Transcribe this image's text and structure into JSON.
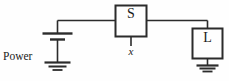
{
  "figure": {
    "kind": "circuit-diagram",
    "width": 229,
    "height": 81,
    "background_color": "#fefefe",
    "line_color": "#2b2b2b",
    "text_color": "#1a1a1a"
  },
  "labels": {
    "power_supply_line1": "Power",
    "power_supply_line2": "supply",
    "switch_box": "S",
    "load_box": "L",
    "switch_node": "x"
  },
  "components": [
    {
      "name": "power-supply",
      "type": "battery",
      "label": "Power supply",
      "plates": 2,
      "grounded": true
    },
    {
      "name": "switch",
      "type": "box",
      "label": "S",
      "node_label": "x"
    },
    {
      "name": "load",
      "type": "box",
      "label": "L",
      "grounded": true
    }
  ],
  "wires": [
    {
      "name": "supply-to-switch",
      "from": "power-supply",
      "to": "switch"
    },
    {
      "name": "switch-to-load",
      "from": "switch",
      "to": "load"
    },
    {
      "name": "switch-node-stub",
      "from": "switch",
      "to": "x"
    }
  ],
  "grounds": [
    {
      "name": "supply-ground",
      "bars": 3
    },
    {
      "name": "load-ground",
      "bars": 3
    }
  ]
}
